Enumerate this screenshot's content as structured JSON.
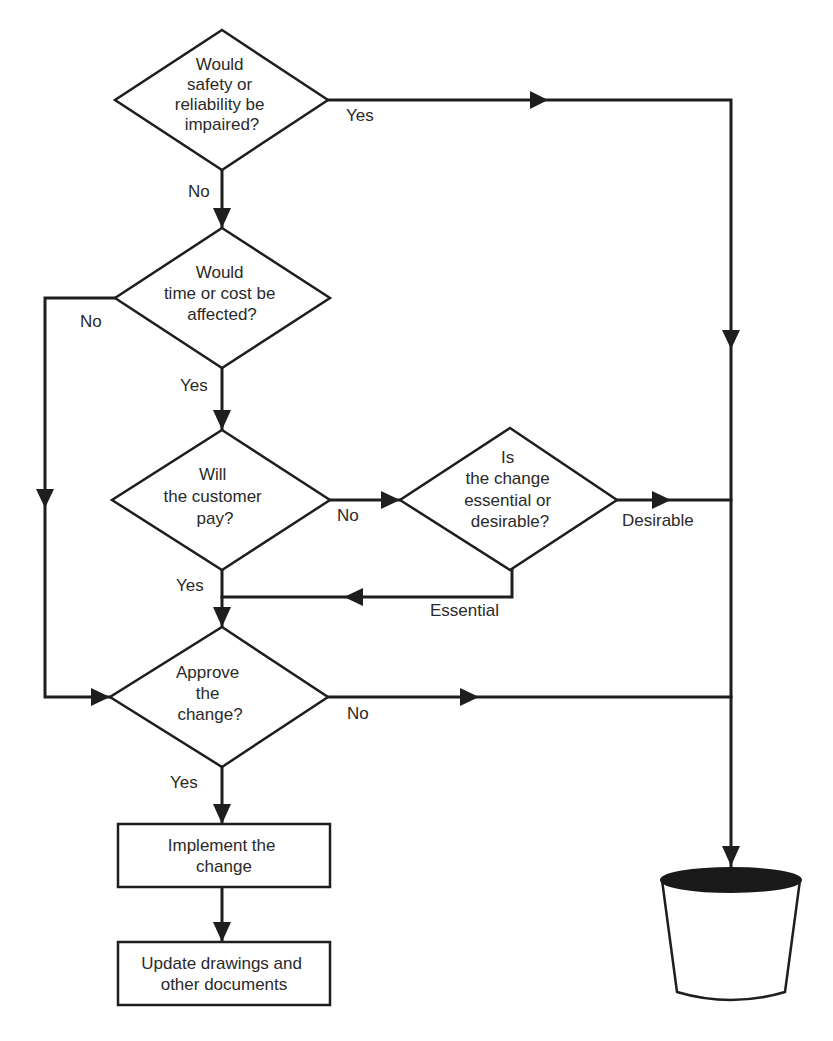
{
  "nodes": {
    "d1": {
      "lines": [
        "Would",
        "safety or",
        "reliability be",
        "impaired?"
      ]
    },
    "d2": {
      "lines": [
        "Would",
        "time or cost be",
        "affected?"
      ]
    },
    "d3": {
      "lines": [
        "Will",
        "the customer",
        "pay?"
      ]
    },
    "d3b": {
      "lines": [
        "Is",
        "the change",
        "essential or",
        "desirable?"
      ]
    },
    "d4": {
      "lines": [
        "Approve",
        "the",
        "change?"
      ]
    },
    "box1": {
      "lines": [
        "Implement the",
        "change"
      ]
    },
    "box2": {
      "lines": [
        "Update drawings and",
        "other documents"
      ]
    },
    "bin": {
      "icon": "waste-bin-icon"
    }
  },
  "labels": {
    "d1_yes": "Yes",
    "d1_no": "No",
    "d2_no": "No",
    "d2_yes": "Yes",
    "d3_no": "No",
    "d3_yes": "Yes",
    "d3b_desirable": "Desirable",
    "d3b_essential": "Essential",
    "d4_no": "No",
    "d4_yes": "Yes"
  },
  "colors": {
    "stroke": "#1e1e1e",
    "text": "#2a2a2a",
    "bin_top": "#1a1a1a"
  }
}
